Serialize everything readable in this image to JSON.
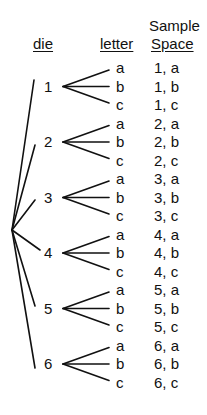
{
  "headers": {
    "die": "die",
    "letter": "letter",
    "sample_line1": "Sample",
    "sample_line2": "Space"
  },
  "die_outcomes": [
    "1",
    "2",
    "3",
    "4",
    "5",
    "6"
  ],
  "letter_outcomes": [
    "a",
    "b",
    "c"
  ],
  "sample_space": [
    "1, a",
    "1, b",
    "1, c",
    "2, a",
    "2, b",
    "2, c",
    "3, a",
    "3, b",
    "3, c",
    "4, a",
    "4, b",
    "4, c",
    "5, a",
    "5, b",
    "5, c",
    "6, a",
    "6, b",
    "6, c"
  ],
  "colors": {
    "ink": "#111111",
    "background": "#ffffff"
  }
}
